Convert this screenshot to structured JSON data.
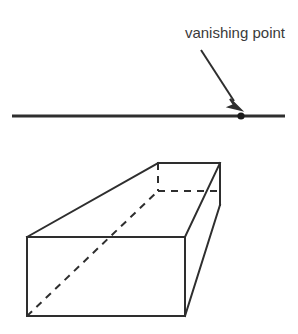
{
  "figure": {
    "background_color": "#ffffff",
    "line_color": "#2e2e2e",
    "text_color": "#3a3a3a"
  },
  "annotation": {
    "label": "vanishing point",
    "label_x": 285,
    "label_y": 38,
    "font_size": 15,
    "arrow": {
      "from_x": 201,
      "from_y": 50,
      "to_x": 240,
      "to_y": 110,
      "head_width": 9,
      "head_length": 13
    }
  },
  "horizon_line": {
    "name": "horizon-line",
    "x1": 12,
    "y1": 116,
    "x2": 285,
    "y2": 116,
    "stroke_width": 3
  },
  "vanishing_point": {
    "name": "vanishing-point-dot",
    "cx": 241,
    "cy": 116,
    "r": 3.6
  },
  "box": {
    "name": "perspective-box",
    "stroke_width": 2,
    "dash_pattern": "7,6",
    "vertices": {
      "front_top_left": [
        27,
        237
      ],
      "front_top_right": [
        185,
        237
      ],
      "front_bottom_left": [
        27,
        316
      ],
      "front_bottom_right": [
        185,
        316
      ],
      "back_top_left": [
        158,
        163
      ],
      "back_top_right": [
        220,
        163
      ],
      "back_bottom_left_hidden": [
        158,
        191
      ],
      "back_bottom_right": [
        220,
        205
      ]
    },
    "solid_edges": [
      "front-top-edge",
      "front-left-edge",
      "front-bottom-edge",
      "front-right-edge",
      "top-left-receding-edge",
      "top-right-receding-edge",
      "top-back-edge",
      "right-back-vertical-edge",
      "bottom-right-receding-edge"
    ],
    "hidden_edges": [
      "hidden-back-vertical-edge",
      "hidden-back-horizontal-edge",
      "hidden-body-diagonal"
    ]
  }
}
